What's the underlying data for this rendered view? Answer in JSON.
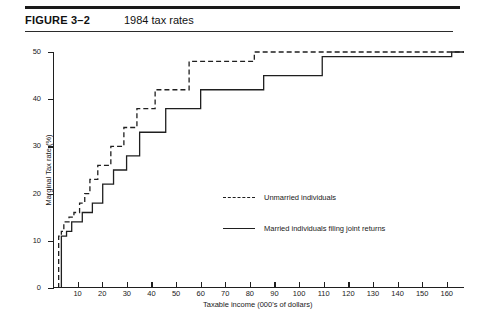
{
  "figure": {
    "label": "FIGURE 3–2",
    "title": "1984 tax rates"
  },
  "chart_data": {
    "type": "line",
    "subtype": "step",
    "title": "1984 tax rates",
    "xlabel": "Taxable income (000's of dollars)",
    "ylabel": "Marginal Tax rate (%)",
    "xlim": [
      0,
      167
    ],
    "ylim": [
      0,
      50
    ],
    "grid": false,
    "legend_position": "center",
    "xticks": [
      10,
      20,
      30,
      40,
      50,
      60,
      70,
      80,
      90,
      100,
      110,
      120,
      130,
      140,
      150,
      160
    ],
    "xtick_labels": [
      "10",
      "20",
      "30",
      "40",
      "50",
      "60",
      "70",
      "80",
      "90",
      "100",
      "110",
      "120",
      "130",
      "140",
      "150",
      "160"
    ],
    "yticks": [
      0,
      10,
      20,
      30,
      40,
      50
    ],
    "ytick_labels": [
      "0",
      "10",
      "20",
      "30",
      "40",
      "50"
    ],
    "series": [
      {
        "name": "Unmarried individuals",
        "style": "dashed",
        "color": "#1f1f1f",
        "steps": [
          {
            "x_start": 2.3,
            "x_end": 3.4,
            "y": 11
          },
          {
            "x_start": 3.4,
            "x_end": 4.4,
            "y": 12
          },
          {
            "x_start": 4.4,
            "x_end": 6.5,
            "y": 14
          },
          {
            "x_start": 6.5,
            "x_end": 8.5,
            "y": 15
          },
          {
            "x_start": 8.5,
            "x_end": 10.8,
            "y": 16
          },
          {
            "x_start": 10.8,
            "x_end": 12.9,
            "y": 18
          },
          {
            "x_start": 12.9,
            "x_end": 15.0,
            "y": 20
          },
          {
            "x_start": 15.0,
            "x_end": 18.2,
            "y": 23
          },
          {
            "x_start": 18.2,
            "x_end": 23.5,
            "y": 26
          },
          {
            "x_start": 23.5,
            "x_end": 28.8,
            "y": 30
          },
          {
            "x_start": 28.8,
            "x_end": 34.1,
            "y": 34
          },
          {
            "x_start": 34.1,
            "x_end": 41.5,
            "y": 38
          },
          {
            "x_start": 41.5,
            "x_end": 55.3,
            "y": 42
          },
          {
            "x_start": 55.3,
            "x_end": 81.8,
            "y": 48
          },
          {
            "x_start": 81.8,
            "x_end": 167.0,
            "y": 50
          }
        ]
      },
      {
        "name": "Married individuals filing joint returns",
        "style": "solid",
        "color": "#1f1f1f",
        "steps": [
          {
            "x_start": 3.4,
            "x_end": 5.5,
            "y": 11
          },
          {
            "x_start": 5.5,
            "x_end": 7.6,
            "y": 12
          },
          {
            "x_start": 7.6,
            "x_end": 11.9,
            "y": 14
          },
          {
            "x_start": 11.9,
            "x_end": 16.0,
            "y": 16
          },
          {
            "x_start": 16.0,
            "x_end": 20.2,
            "y": 18
          },
          {
            "x_start": 20.2,
            "x_end": 24.6,
            "y": 22
          },
          {
            "x_start": 24.6,
            "x_end": 29.9,
            "y": 25
          },
          {
            "x_start": 29.9,
            "x_end": 35.2,
            "y": 28
          },
          {
            "x_start": 35.2,
            "x_end": 45.8,
            "y": 33
          },
          {
            "x_start": 45.8,
            "x_end": 60.0,
            "y": 38
          },
          {
            "x_start": 60.0,
            "x_end": 85.6,
            "y": 42
          },
          {
            "x_start": 85.6,
            "x_end": 109.4,
            "y": 45
          },
          {
            "x_start": 109.4,
            "x_end": 162.0,
            "y": 49
          },
          {
            "x_start": 162.0,
            "x_end": 167.0,
            "y": 50
          }
        ]
      }
    ]
  },
  "legend": {
    "items": [
      {
        "label": "Unmarried individuals",
        "style": "dashed"
      },
      {
        "label": "Married individuals filing joint returns",
        "style": "solid"
      }
    ]
  }
}
